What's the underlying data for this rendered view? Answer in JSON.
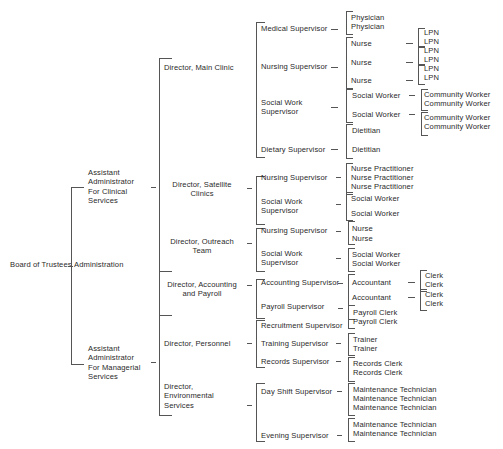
{
  "chart": {
    "root": "Board of Trustees",
    "admin": "Administration",
    "asst_clinical": [
      "Assistant",
      "Administrator",
      "For Clinical",
      "Services"
    ],
    "asst_managerial": [
      "Assistant",
      "Administrator",
      "For Managerial",
      "Services"
    ],
    "directors": {
      "main_clinic": "Director, Main Clinic",
      "satellite": [
        "Director, Satellite",
        "Clinics"
      ],
      "outreach": [
        "Director, Outreach",
        "Team"
      ],
      "accounting": [
        "Director, Accounting",
        "and Payroll"
      ],
      "personnel": "Director, Personnel",
      "environmental": [
        "Director,",
        "Environmental",
        "Services"
      ]
    },
    "supervisors": {
      "medical": "Medical Supervisor",
      "nursing": "Nursing Supervisor",
      "social_work": [
        "Social Work",
        "Supervisor"
      ],
      "dietary": "Dietary Supervisor",
      "accounting": "Accounting Supervisor",
      "payroll": "Payroll Supervisor",
      "recruitment": "Recruitment Supervisor",
      "training": "Training Supervisor",
      "records": "Records Supervisor",
      "day_shift": "Day Shift Supervisor",
      "evening": "Evening Supervisor"
    },
    "staff": {
      "physician": "Physician",
      "nurse": "Nurse",
      "social_worker": "Social Worker",
      "dietitian": "Dietitian",
      "nurse_practitioner": "Nurse Practitioner",
      "accountant": "Accountant",
      "payroll_clerk": "Payroll Clerk",
      "trainer": "Trainer",
      "records_clerk": "Records Clerk",
      "maintenance_tech": "Maintenance Technician",
      "lpn": "LPN",
      "community_worker": "Community Worker",
      "clerk": "Clerk"
    }
  }
}
